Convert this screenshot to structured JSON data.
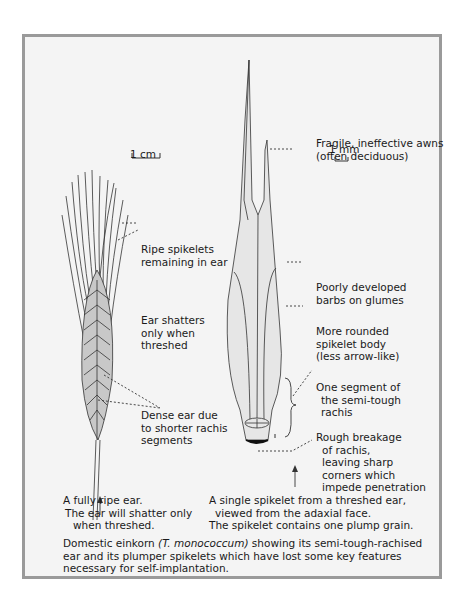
{
  "figure": {
    "colors": {
      "frame_border": "#9a9a9a",
      "frame_background": "#f4f4f4",
      "outline": "#333333",
      "fill": "#c8c8c8",
      "spikelet_fill": "#e6e6e6"
    },
    "left_specimen": {
      "scale_label": "1 cm",
      "labels": {
        "ripe_spikelets": [
          "Ripe spikelets",
          "remaining in ear"
        ],
        "ear_shatters": [
          "Ear shatters",
          "only when",
          "threshed"
        ],
        "dense_ear": [
          "Dense ear due",
          "to shorter rachis",
          "segments"
        ]
      },
      "caption": [
        "A fully ripe ear.",
        "The ear will shatter only",
        "when threshed."
      ]
    },
    "right_specimen": {
      "scale_label": "1 mm",
      "labels": {
        "awns": [
          "Fragile, ineffective awns",
          "(often deciduous)"
        ],
        "barbs": [
          "Poorly developed",
          "barbs on glumes"
        ],
        "body": [
          "More rounded",
          "spikelet body",
          "(less arrow-like)"
        ],
        "segment": [
          "One segment of",
          "the semi-tough",
          "rachis"
        ],
        "breakage": [
          "Rough breakage",
          "of rachis,",
          "leaving sharp",
          "corners which",
          "impede penetration"
        ]
      },
      "caption": [
        "A single spikelet from a threshed ear,",
        "viewed from the adaxial face.",
        "The spikelet contains one plump grain."
      ]
    },
    "figure_caption": {
      "prefix": "Domestic einkorn ",
      "species": "(T. monococcum)",
      "rest_line1": " showing its semi-tough-rachised",
      "line2": "ear and its plumper spikelets which have lost some key features",
      "line3": "necessary for self-implantation."
    }
  }
}
